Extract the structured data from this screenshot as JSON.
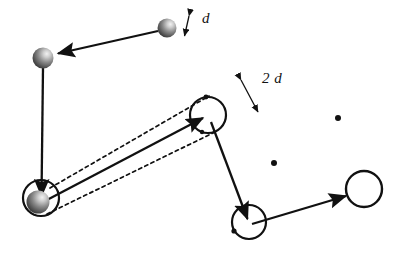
{
  "figure": {
    "type": "diagram",
    "title": "",
    "background_color": "#ffffff",
    "stroke_color": "#111111",
    "sphere_color_dark": "#4a4a4a",
    "sphere_color_light": "#e8e8e8",
    "width": 401,
    "height": 261
  },
  "labels": {
    "d": "d",
    "two_d": "2 d"
  },
  "nodes": {
    "sphere_top_right": {
      "name": "sphere-top-right",
      "cx": 167,
      "cy": 28,
      "r": 9,
      "kind": "shaded-sphere"
    },
    "sphere_top_left": {
      "name": "sphere-top-left",
      "cx": 43,
      "cy": 58,
      "r": 10,
      "kind": "shaded-sphere"
    },
    "circle_bottom_left": {
      "name": "circle-bottom-left",
      "cx": 41,
      "cy": 198,
      "r": 18,
      "kind": "open-circle"
    },
    "sphere_bottom_left": {
      "name": "sphere-bottom-left",
      "cx": 38,
      "cy": 202,
      "r": 11,
      "kind": "shaded-sphere"
    },
    "circle_center": {
      "name": "circle-center",
      "cx": 208,
      "cy": 115,
      "r": 18,
      "kind": "open-circle"
    },
    "circle_bottom_center": {
      "name": "circle-bottom-center",
      "cx": 249,
      "cy": 222,
      "r": 17,
      "kind": "open-circle"
    },
    "circle_right": {
      "name": "circle-right",
      "cx": 364,
      "cy": 189,
      "r": 18,
      "kind": "open-circle"
    }
  },
  "dots": [
    {
      "name": "ellipsis-dot-upper",
      "cx": 338,
      "cy": 118,
      "r": 3
    },
    {
      "name": "ellipsis-dot-lower",
      "cx": 274,
      "cy": 163,
      "r": 3
    }
  ],
  "edges": [
    {
      "name": "arrow-top-right-to-top-left",
      "x1": 158,
      "y1": 31,
      "x2": 55,
      "y2": 54,
      "style": "solid",
      "arrow": "end"
    },
    {
      "name": "arrow-top-left-to-bottom-left",
      "x1": 43,
      "y1": 68,
      "x2": 41,
      "y2": 192,
      "style": "solid",
      "arrow": "end"
    },
    {
      "name": "arrow-bottom-left-to-center",
      "x1": 45,
      "y1": 200,
      "x2": 200,
      "y2": 119,
      "style": "solid",
      "arrow": "end"
    },
    {
      "name": "arrow-center-to-bottom-center",
      "x1": 211,
      "y1": 122,
      "x2": 247,
      "y2": 214,
      "style": "solid",
      "arrow": "end"
    },
    {
      "name": "arrow-bottom-center-to-right",
      "x1": 252,
      "y1": 224,
      "x2": 346,
      "y2": 196,
      "style": "solid",
      "arrow": "end"
    },
    {
      "name": "dashed-guide-upper",
      "x1": 50,
      "y1": 188,
      "x2": 209,
      "y2": 96,
      "style": "dashed",
      "arrow": "none"
    },
    {
      "name": "dashed-guide-lower",
      "x1": 47,
      "y1": 214,
      "x2": 217,
      "y2": 131,
      "style": "dashed",
      "arrow": "none"
    }
  ],
  "measures": [
    {
      "name": "measure-d",
      "label": "d",
      "x1": 190,
      "y1": 13,
      "x2": 184,
      "y2": 37,
      "label_x": 203,
      "label_y": 12
    },
    {
      "name": "measure-2d",
      "label": "2 d",
      "x1": 240,
      "y1": 78,
      "x2": 259,
      "y2": 113,
      "label_x": 262,
      "label_y": 74
    }
  ]
}
